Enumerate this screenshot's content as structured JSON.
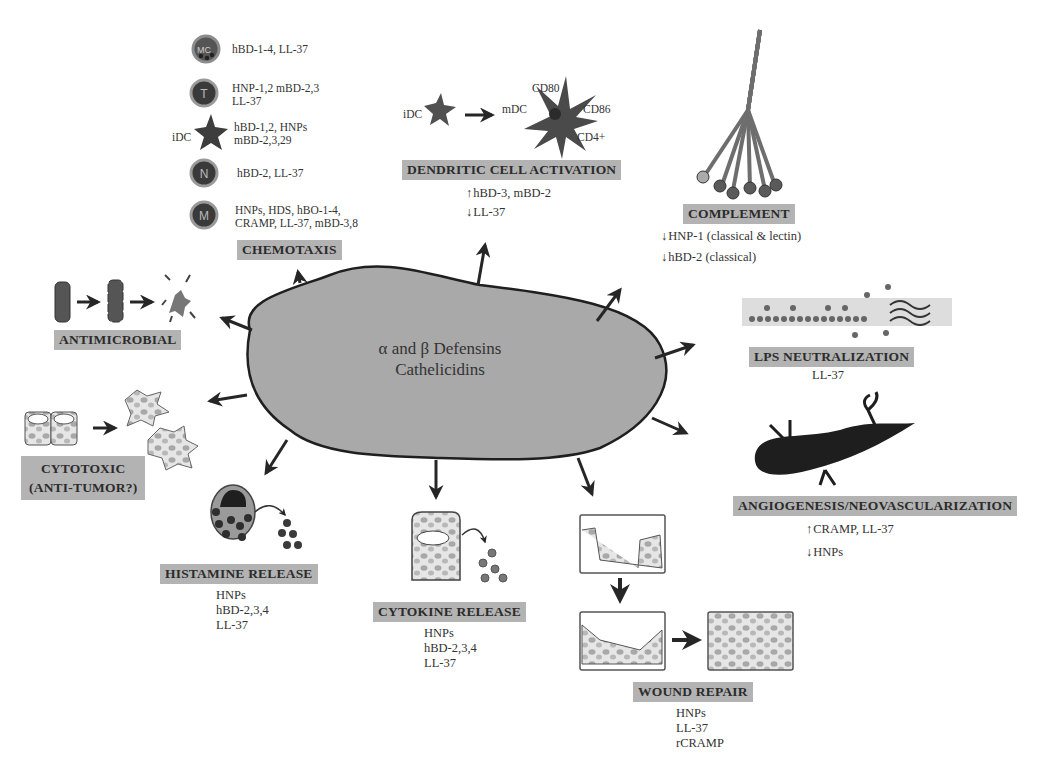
{
  "center": {
    "line1": "α and β Defensins",
    "line2": "Cathelicidins"
  },
  "chemotaxis": {
    "label": "CHEMOTAXIS",
    "cells": [
      {
        "cell": "MC",
        "icon": "mast-cell-icon",
        "text1": "hBD-1-4, LL-37",
        "text2": ""
      },
      {
        "cell": "T",
        "icon": "t-cell-icon",
        "text1": "HNP-1,2 mBD-2,3",
        "text2": "LL-37"
      },
      {
        "cell": "iDC",
        "icon": "immature-dendritic-cell-icon",
        "text1": "hBD-1,2, HNPs",
        "text2": "mBD-2,3,29"
      },
      {
        "cell": "N",
        "icon": "neutrophil-icon",
        "text1": "hBD-2, LL-37",
        "text2": ""
      },
      {
        "cell": "M",
        "icon": "monocyte-icon",
        "text1": "HNPs, HDS, hBO-1-4,",
        "text2": "CRAMP, LL-37, mBD-3,8"
      }
    ]
  },
  "dendritic": {
    "label": "DENDRITIC CELL ACTIVATION",
    "idc": "iDC",
    "mdc": "mDC",
    "markers": [
      "CD80",
      "CD86",
      "CD4+"
    ],
    "up": "hBD-3, mBD-2",
    "down": "LL-37"
  },
  "complement": {
    "label": "COMPLEMENT",
    "down1": "HNP-1 (classical & lectin)",
    "down2": "hBD-2 (classical)"
  },
  "lps": {
    "label": "LPS NEUTRALIZATION",
    "agent": "LL-37"
  },
  "angiogenesis": {
    "label": "ANGIOGENESIS/NEOVASCULARIZATION",
    "up": "CRAMP, LL-37",
    "down": "HNPs"
  },
  "wound": {
    "label": "WOUND REPAIR",
    "agents": [
      "HNPs",
      "LL-37",
      "rCRAMP"
    ]
  },
  "cytokine": {
    "label": "CYTOKINE RELEASE",
    "agents": [
      "HNPs",
      "hBD-2,3,4",
      "LL-37"
    ]
  },
  "histamine": {
    "label": "HISTAMINE RELEASE",
    "agents": [
      "HNPs",
      "hBD-2,3,4",
      "LL-37"
    ]
  },
  "cytotoxic": {
    "label1": "CYTOTOXIC",
    "label2": "(ANTI-TUMOR?)"
  },
  "antimicrobial": {
    "label": "ANTIMICROBIAL"
  },
  "colors": {
    "blob_fill": "#a9a9a9",
    "label_bg": "#b3b3b3",
    "dark": "#3a3a3a",
    "ink": "#1f1f1f"
  }
}
